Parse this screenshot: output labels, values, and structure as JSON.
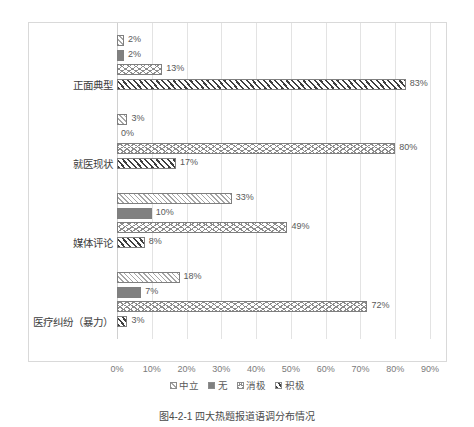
{
  "chart_data": {
    "type": "bar",
    "orientation": "horizontal",
    "title": "图4-2-1 四大热题报道语调分布情况",
    "xlabel": "",
    "ylabel": "",
    "xlim": [
      0,
      90
    ],
    "xticks": [
      "0%",
      "10%",
      "20%",
      "30%",
      "40%",
      "50%",
      "60%",
      "70%",
      "80%",
      "90%"
    ],
    "xtick_values": [
      0,
      10,
      20,
      30,
      40,
      50,
      60,
      70,
      80,
      90
    ],
    "grid": true,
    "legend_position": "bottom",
    "categories": [
      "正面典型",
      "就医现状",
      "媒体评论",
      "医疗纠纷（暴力）"
    ],
    "series": [
      {
        "name": "中立",
        "pattern": "diagonal-hatch",
        "values": [
          2,
          3,
          33,
          18
        ],
        "labels": [
          "2%",
          "3%",
          "33%",
          "18%"
        ]
      },
      {
        "name": "无",
        "pattern": "solid-gray",
        "values": [
          2,
          0,
          10,
          7
        ],
        "labels": [
          "2%",
          "0%",
          "10%",
          "7%"
        ]
      },
      {
        "name": "消极",
        "pattern": "crosshatch-wave",
        "values": [
          13,
          80,
          49,
          72
        ],
        "labels": [
          "13%",
          "80%",
          "49%",
          "72%"
        ]
      },
      {
        "name": "积极",
        "pattern": "bold-diagonal",
        "values": [
          83,
          17,
          8,
          3
        ],
        "labels": [
          "83%",
          "17%",
          "8%",
          "3%"
        ]
      }
    ]
  },
  "legend": {
    "items": [
      {
        "label": "中立"
      },
      {
        "label": "无"
      },
      {
        "label": "消极"
      },
      {
        "label": "积极"
      }
    ]
  },
  "caption": {
    "text": "图4-2-1 四大热题报道语调分布情况"
  },
  "colors": {
    "frame": "#d9d9d9",
    "gridline": "#e3e3e3",
    "bar_outline": "#7f7f7f",
    "label_text": "#595959",
    "solid_fill": "#808080"
  }
}
